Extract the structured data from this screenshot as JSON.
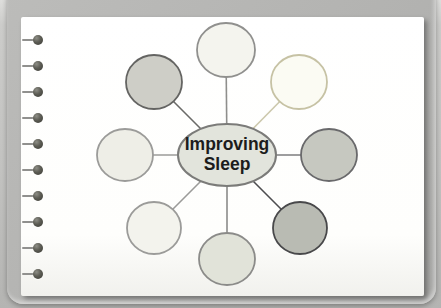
{
  "scene": {
    "description": "photographed spiral-bound notebook page with a spider diagram",
    "background_color": "#c2c2c0",
    "cover_color": "#b0b0ae",
    "paper_color": "#ffffff"
  },
  "binding": {
    "hole_count": 10,
    "hole_x": 38,
    "first_hole_y": 40,
    "hole_spacing": 26,
    "hole_diameter": 10,
    "hole_color_dark": "#3a3a34",
    "stub_color": "#90908e",
    "stub_length": 14
  },
  "diagram": {
    "type": "spider-diagram",
    "center": {
      "label": "Improving Sleep",
      "label_lines": [
        "Improving",
        "Sleep"
      ],
      "cx": 227,
      "cy": 155,
      "rx": 49,
      "ry": 31,
      "fill": "#e2e4dc",
      "stroke": "#7b7b79",
      "text_color": "#1c1c1c",
      "font_size": 17.5
    },
    "nodes": [
      {
        "name": "node-top",
        "label": "",
        "cx": 226,
        "cy": 50,
        "rx": 29,
        "ry": 27,
        "fill": "#f4f4ee",
        "stroke": "#90908e",
        "line": "#8e8e8c"
      },
      {
        "name": "node-top-right",
        "label": "",
        "cx": 299,
        "cy": 82,
        "rx": 28,
        "ry": 27,
        "fill": "#fbfbf3",
        "stroke": "#c6c2a4",
        "line": "#ccc8ac"
      },
      {
        "name": "node-right",
        "label": "",
        "cx": 329,
        "cy": 155,
        "rx": 28,
        "ry": 26,
        "fill": "#c6c8c0",
        "stroke": "#69696b",
        "line": "#7c7c7e"
      },
      {
        "name": "node-bottom-right",
        "label": "",
        "cx": 300,
        "cy": 228,
        "rx": 27,
        "ry": 26,
        "fill": "#b9bbb3",
        "stroke": "#48484a",
        "line": "#4d4d4f"
      },
      {
        "name": "node-bottom",
        "label": "",
        "cx": 227,
        "cy": 259,
        "rx": 28,
        "ry": 26,
        "fill": "#e1e3d9",
        "stroke": "#8b8b89",
        "line": "#8b8b89"
      },
      {
        "name": "node-bottom-left",
        "label": "",
        "cx": 154,
        "cy": 228,
        "rx": 27,
        "ry": 26,
        "fill": "#f3f3ed",
        "stroke": "#9b9b99",
        "line": "#9b9b99"
      },
      {
        "name": "node-left",
        "label": "",
        "cx": 125,
        "cy": 155,
        "rx": 28,
        "ry": 26,
        "fill": "#eeeee7",
        "stroke": "#9b9b99",
        "line": "#9b9b99"
      },
      {
        "name": "node-top-left",
        "label": "",
        "cx": 154,
        "cy": 82,
        "rx": 28,
        "ry": 27,
        "fill": "#cecec7",
        "stroke": "#646462",
        "line": "#6a6a68"
      }
    ],
    "line_width": 1.6,
    "node_stroke_width": 1.8,
    "center_stroke_width": 2
  }
}
